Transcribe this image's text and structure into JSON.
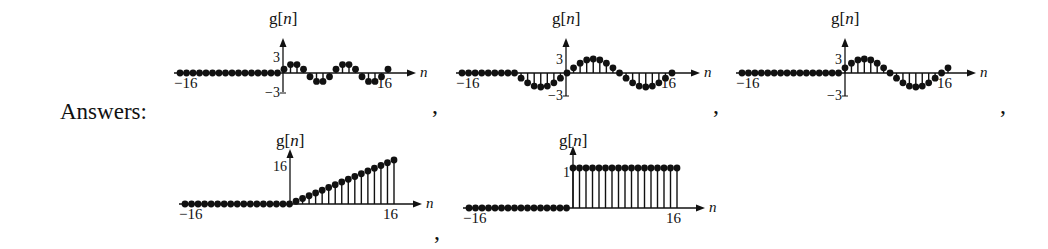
{
  "label": "Answers:",
  "separator": ",",
  "chart_data": [
    {
      "type": "stem",
      "title": "g[n]",
      "xlabel": "n",
      "xticks": [
        "-16",
        "16"
      ],
      "yticks": [
        "3",
        "-3"
      ],
      "xlim": [
        -16,
        16
      ],
      "ylim": [
        -3,
        3
      ],
      "description": "zero for n<0; sinusoid period 8 for n>=0",
      "x": [
        -16,
        -15,
        -14,
        -13,
        -12,
        -11,
        -10,
        -9,
        -8,
        -7,
        -6,
        -5,
        -4,
        -3,
        -2,
        -1,
        0,
        1,
        2,
        3,
        4,
        5,
        6,
        7,
        8,
        9,
        10,
        11,
        12,
        13,
        14,
        15,
        16
      ],
      "values": [
        0,
        0,
        0,
        0,
        0,
        0,
        0,
        0,
        0,
        0,
        0,
        0,
        0,
        0,
        0,
        0,
        0.8,
        1.8,
        1.8,
        0.8,
        -0.8,
        -1.8,
        -1.8,
        -0.8,
        0.8,
        1.8,
        1.8,
        0.8,
        -0.8,
        -1.8,
        -1.8,
        -0.8,
        0.8
      ]
    },
    {
      "type": "stem",
      "title": "g[n]",
      "xlabel": "n",
      "xticks": [
        "-16",
        "16"
      ],
      "yticks": [
        "3",
        "-3"
      ],
      "xlim": [
        -16,
        16
      ],
      "ylim": [
        -3,
        3
      ],
      "description": "zero for n<-8; sinusoid period 16 for n>=-8",
      "x": [
        -16,
        -15,
        -14,
        -13,
        -12,
        -11,
        -10,
        -9,
        -8,
        -7,
        -6,
        -5,
        -4,
        -3,
        -2,
        -1,
        0,
        1,
        2,
        3,
        4,
        5,
        6,
        7,
        8,
        9,
        10,
        11,
        12,
        13,
        14,
        15,
        16
      ],
      "values": [
        0,
        0,
        0,
        0,
        0,
        0,
        0,
        0,
        0,
        -1.1,
        -2.1,
        -2.8,
        -3,
        -2.8,
        -2.1,
        -1.1,
        0,
        1.1,
        2.1,
        2.8,
        3,
        2.8,
        2.1,
        1.1,
        0,
        -1.1,
        -2.1,
        -2.8,
        -3,
        -2.8,
        -2.1,
        -1.1,
        0
      ]
    },
    {
      "type": "stem",
      "title": "g[n]",
      "xlabel": "n",
      "xticks": [
        "-16",
        "16"
      ],
      "yticks": [
        "3",
        "-3"
      ],
      "xlim": [
        -16,
        16
      ],
      "ylim": [
        -3,
        3
      ],
      "description": "zero for n<0; phase-shifted sinusoid period 16 for n>=0",
      "x": [
        -16,
        -15,
        -14,
        -13,
        -12,
        -11,
        -10,
        -9,
        -8,
        -7,
        -6,
        -5,
        -4,
        -3,
        -2,
        -1,
        0,
        1,
        2,
        3,
        4,
        5,
        6,
        7,
        8,
        9,
        10,
        11,
        12,
        13,
        14,
        15,
        16
      ],
      "values": [
        0,
        0,
        0,
        0,
        0,
        0,
        0,
        0,
        0,
        0,
        0,
        0,
        0,
        0,
        0,
        0,
        1.1,
        2.1,
        2.8,
        3,
        2.8,
        2.1,
        1.1,
        0,
        -1.1,
        -2.1,
        -2.8,
        -3,
        -2.8,
        -2.1,
        -1.1,
        0,
        1.1
      ]
    },
    {
      "type": "stem",
      "title": "g[n]",
      "xlabel": "n",
      "xticks": [
        "-16",
        "16"
      ],
      "yticks": [
        "16"
      ],
      "xlim": [
        -16,
        16
      ],
      "ylim": [
        0,
        16
      ],
      "description": "ramp: g[n]=n for n>=0, 0 otherwise",
      "x": [
        -16,
        -15,
        -14,
        -13,
        -12,
        -11,
        -10,
        -9,
        -8,
        -7,
        -6,
        -5,
        -4,
        -3,
        -2,
        -1,
        0,
        1,
        2,
        3,
        4,
        5,
        6,
        7,
        8,
        9,
        10,
        11,
        12,
        13,
        14,
        15,
        16
      ],
      "values": [
        0,
        0,
        0,
        0,
        0,
        0,
        0,
        0,
        0,
        0,
        0,
        0,
        0,
        0,
        0,
        0,
        0,
        1,
        2,
        3,
        4,
        5,
        6,
        7,
        8,
        9,
        10,
        11,
        12,
        13,
        14,
        15,
        16
      ]
    },
    {
      "type": "stem",
      "title": "g[n]",
      "xlabel": "n",
      "xticks": [
        "-16",
        "16"
      ],
      "yticks": [
        "1"
      ],
      "xlim": [
        -16,
        16
      ],
      "ylim": [
        0,
        1
      ],
      "description": "unit step: g[n]=1 for n>=0, 0 otherwise",
      "x": [
        -16,
        -15,
        -14,
        -13,
        -12,
        -11,
        -10,
        -9,
        -8,
        -7,
        -6,
        -5,
        -4,
        -3,
        -2,
        -1,
        0,
        1,
        2,
        3,
        4,
        5,
        6,
        7,
        8,
        9,
        10,
        11,
        12,
        13,
        14,
        15,
        16
      ],
      "values": [
        0,
        0,
        0,
        0,
        0,
        0,
        0,
        0,
        0,
        0,
        0,
        0,
        0,
        0,
        0,
        0,
        1,
        1,
        1,
        1,
        1,
        1,
        1,
        1,
        1,
        1,
        1,
        1,
        1,
        1,
        1,
        1,
        1
      ]
    }
  ]
}
